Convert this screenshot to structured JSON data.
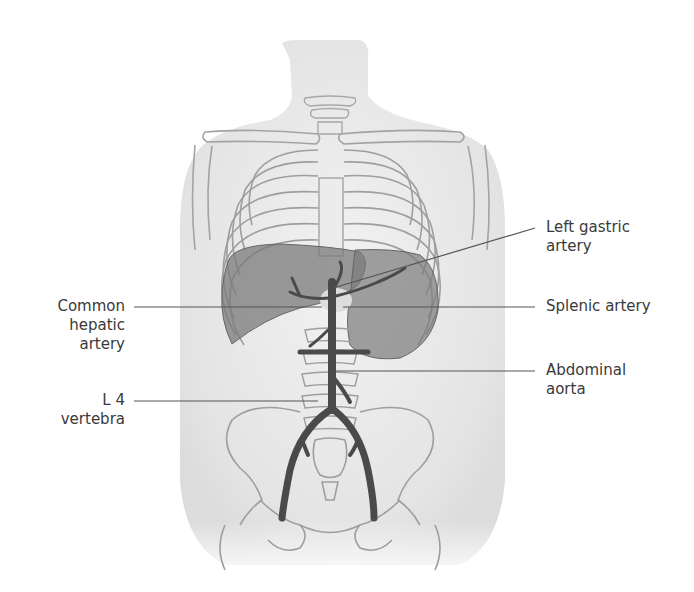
{
  "figure": {
    "colors": {
      "background": "#ffffff",
      "body": "#e9e9e9",
      "bone_outline": "#9a9a9a",
      "organ_fill": "#7c7c7c",
      "artery": "#4a4a4a",
      "leader_line": "#555555",
      "label_text": "#3a3a3a"
    }
  },
  "labels": {
    "left_gastric_artery": "Left gastric\nartery",
    "common_hepatic_artery": "Common\nhepatic\nartery",
    "splenic_artery": "Splenic artery",
    "abdominal_aorta": "Abdominal\naorta",
    "l4_vertebra": "L 4\nvertebra"
  }
}
